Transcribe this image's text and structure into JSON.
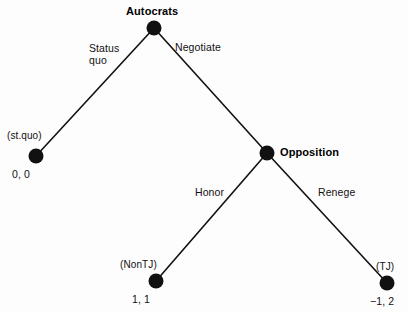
{
  "figure": {
    "type": "game-tree",
    "background_color": "#fdfdfd",
    "node_color": "#111111",
    "edge_color": "#111111"
  },
  "nodes": {
    "root": {
      "player_label": "Autocrats",
      "x": 154,
      "y": 28,
      "radius": 7.5
    },
    "opposition": {
      "player_label": "Opposition",
      "x": 267,
      "y": 153,
      "radius": 7.5
    },
    "terminal_stquo": {
      "outcome_label": "(st.quo)",
      "payoff_label": "0, 0",
      "x": 36,
      "y": 156,
      "radius": 7.5
    },
    "terminal_nontj": {
      "outcome_label": "(NonTJ)",
      "payoff_label": "1, 1",
      "x": 156,
      "y": 281,
      "radius": 7.5
    },
    "terminal_tj": {
      "outcome_label": "(TJ)",
      "payoff_label": "−1, 2",
      "x": 387,
      "y": 283,
      "radius": 7.5
    }
  },
  "edges": {
    "status_quo": {
      "action_label_line1": "Status",
      "action_label_line2": "quo"
    },
    "negotiate": {
      "action_label": "Negotiate"
    },
    "honor": {
      "action_label": "Honor"
    },
    "renege": {
      "action_label": "Renege"
    }
  },
  "chart_data": {
    "type": "diagram",
    "title": "",
    "tree": {
      "node": "Autocrats",
      "children": [
        {
          "action": "Status quo",
          "node": "(st.quo)",
          "payoffs": [
            0,
            0
          ],
          "terminal": true
        },
        {
          "action": "Negotiate",
          "node": "Opposition",
          "terminal": false,
          "children": [
            {
              "action": "Honor",
              "node": "(NonTJ)",
              "payoffs": [
                1,
                1
              ],
              "terminal": true
            },
            {
              "action": "Renege",
              "node": "(TJ)",
              "payoffs": [
                -1,
                2
              ],
              "terminal": true
            }
          ]
        }
      ]
    }
  }
}
